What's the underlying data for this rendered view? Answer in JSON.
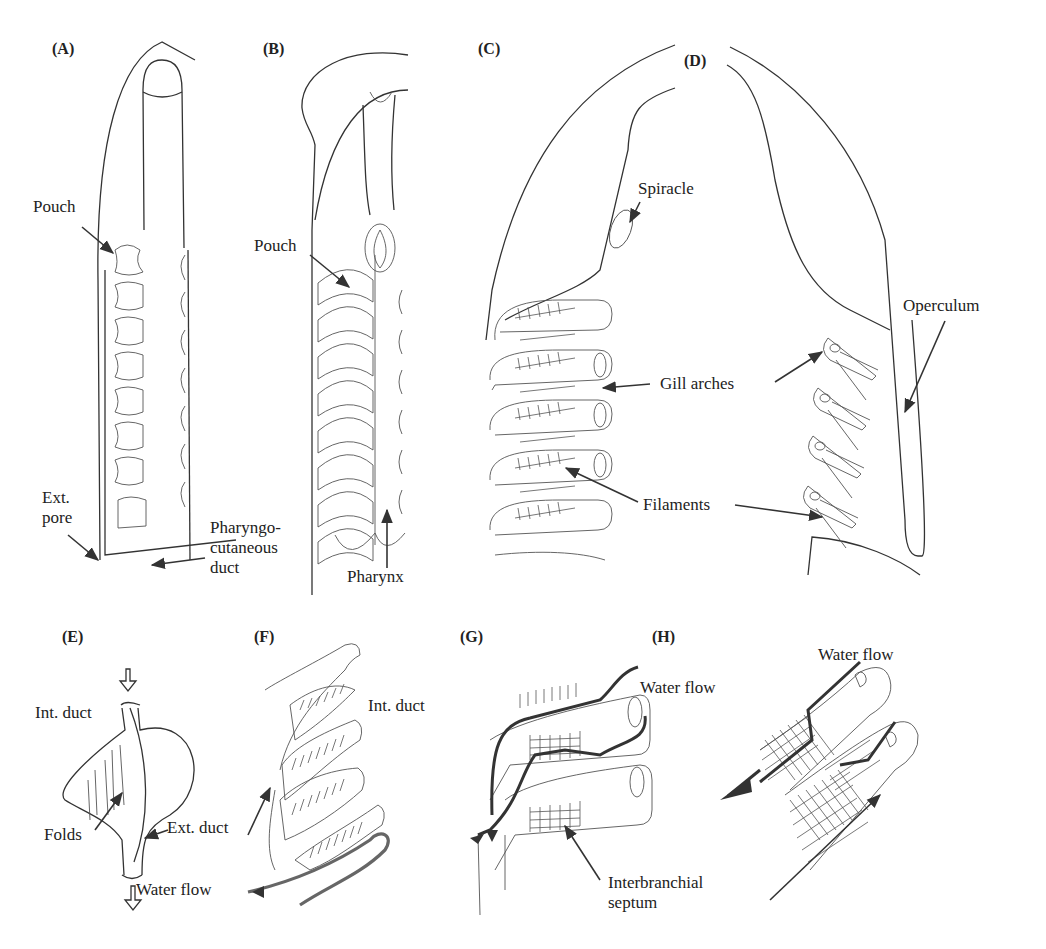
{
  "figure": {
    "panels": [
      {
        "id": "A",
        "label": "(A)",
        "annotations": [
          "Pouch",
          "Ext.\npore",
          "Pharyngo-\ncutaneous\nduct"
        ]
      },
      {
        "id": "B",
        "label": "(B)",
        "annotations": [
          "Pouch",
          "Pharynx"
        ]
      },
      {
        "id": "C",
        "label": "(C)",
        "annotations": [
          "Spiracle",
          "Gill arches",
          "Filaments"
        ]
      },
      {
        "id": "D",
        "label": "(D)",
        "annotations": [
          "Operculum"
        ]
      },
      {
        "id": "E",
        "label": "(E)",
        "annotations": [
          "Int. duct",
          "Folds",
          "Ext. duct",
          "Water flow"
        ]
      },
      {
        "id": "F",
        "label": "(F)",
        "annotations": [
          "Int. duct"
        ]
      },
      {
        "id": "G",
        "label": "(G)",
        "annotations": [
          "Water flow",
          "Interbranchial\nseptum"
        ]
      },
      {
        "id": "H",
        "label": "(H)",
        "annotations": [
          "Water flow"
        ]
      }
    ]
  },
  "labels": {
    "A": {
      "panel": "(A)",
      "pouch": "Pouch",
      "ext_pore": "Ext.\npore",
      "duct": "Pharyngo-\ncutaneous\nduct"
    },
    "B": {
      "panel": "(B)",
      "pouch": "Pouch",
      "pharynx": "Pharynx"
    },
    "C": {
      "panel": "(C)",
      "spiracle": "Spiracle",
      "gill_arches": "Gill arches",
      "filaments": "Filaments"
    },
    "D": {
      "panel": "(D)",
      "operculum": "Operculum"
    },
    "E": {
      "panel": "(E)",
      "int_duct": "Int. duct",
      "folds": "Folds",
      "ext_duct": "Ext. duct",
      "water_flow": "Water flow"
    },
    "F": {
      "panel": "(F)",
      "int_duct": "Int. duct"
    },
    "G": {
      "panel": "(G)",
      "water_flow": "Water flow",
      "septum": "Interbranchial\nseptum"
    },
    "H": {
      "panel": "(H)",
      "water_flow": "Water flow"
    }
  }
}
